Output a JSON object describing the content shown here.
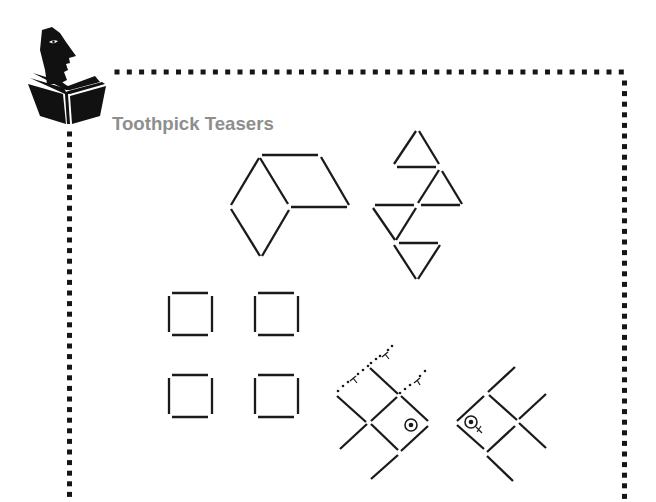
{
  "page": {
    "title": "Toothpick Teasers",
    "colors": {
      "title": "#8e8e8e",
      "ink": "#1a1a1a",
      "background": "#ffffff"
    }
  },
  "logo": {
    "icon": "reader-with-book-icon"
  },
  "border": {
    "style": "dotted-square",
    "sides": [
      "top",
      "left",
      "right"
    ]
  },
  "puzzles": [
    {
      "name": "hexagon-rhombus-puzzle",
      "description": "rhombus shapes made of toothpicks"
    },
    {
      "name": "triangles-puzzle",
      "description": "four triangles made of toothpicks"
    },
    {
      "name": "four-squares-puzzle",
      "description": "four separate squares made of toothpicks"
    },
    {
      "name": "fish-right-puzzle",
      "description": "toothpick fish facing right with dotted moved sticks"
    },
    {
      "name": "fish-left-puzzle",
      "description": "toothpick fish facing left"
    }
  ]
}
